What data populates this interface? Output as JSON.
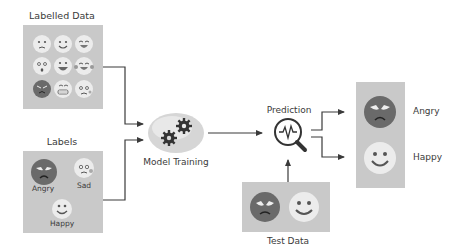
{
  "diagram": {
    "labelled_data": {
      "title": "Labelled Data",
      "faces": [
        "confused",
        "smile",
        "laugh",
        "surprised",
        "grin",
        "laugh-tears",
        "angry",
        "grimace",
        "worried"
      ]
    },
    "labels": {
      "title": "Labels",
      "items": [
        {
          "label": "Angry",
          "face": "angry"
        },
        {
          "label": "Sad",
          "face": "sad"
        },
        {
          "label": "Happy",
          "face": "happy"
        }
      ]
    },
    "model_training": {
      "label": "Model Training",
      "icon": "gears-icon"
    },
    "prediction": {
      "label": "Prediction",
      "icon": "magnifier-pulse-icon"
    },
    "results": {
      "items": [
        {
          "label": "Angry",
          "face": "angry"
        },
        {
          "label": "Happy",
          "face": "happy"
        }
      ]
    },
    "test_data": {
      "title": "Test Data",
      "faces": [
        "angry",
        "happy"
      ]
    },
    "colors": {
      "box": "#c9c9c9",
      "face_light": "#ececec",
      "face_dark": "#6a6a6a",
      "stroke": "#3a3a3a",
      "ellipse": "#d6d6d6"
    }
  }
}
